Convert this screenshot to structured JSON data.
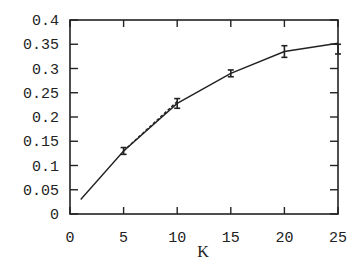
{
  "chart_data": {
    "type": "line",
    "title": "",
    "xlabel": "K",
    "ylabel": "",
    "xlim": [
      0,
      25
    ],
    "ylim": [
      0,
      0.4
    ],
    "grid": false,
    "legend": null,
    "x_ticks": [
      "0",
      "5",
      "10",
      "15",
      "20",
      "25"
    ],
    "y_ticks": [
      "0",
      "0.05",
      "0.1",
      "0.15",
      "0.2",
      "0.25",
      "0.3",
      "0.35",
      "0.4"
    ],
    "series": [
      {
        "name": "solid",
        "style": "solid",
        "x": [
          1,
          5,
          10,
          15,
          20,
          25
        ],
        "values": [
          0.03,
          0.13,
          0.228,
          0.29,
          0.335,
          0.352
        ]
      },
      {
        "name": "dashed",
        "style": "dashed",
        "x": [
          5,
          10
        ],
        "values": [
          0.13,
          0.232
        ]
      },
      {
        "name": "measured",
        "style": "errorbar",
        "x": [
          5,
          10,
          15,
          20,
          25
        ],
        "values": [
          0.13,
          0.228,
          0.29,
          0.335,
          0.34
        ],
        "error": [
          0.007,
          0.01,
          0.007,
          0.012,
          0.01
        ]
      }
    ]
  },
  "axes": {
    "x_label": "K"
  }
}
